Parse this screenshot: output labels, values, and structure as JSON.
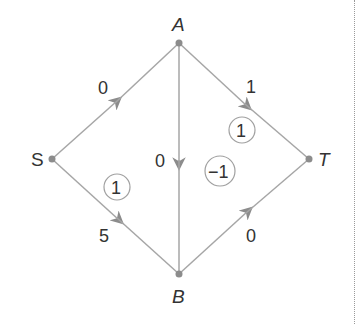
{
  "colors": {
    "edge": "#a6a6a6",
    "node": "#8c8c8c",
    "text": "#333333",
    "circle": "#a0a0a0",
    "border": "#9a9a9a"
  },
  "nodes": [
    {
      "id": "S",
      "label": "S",
      "x": 52,
      "y": 159
    },
    {
      "id": "A",
      "label": "A",
      "x": 179,
      "y": 43
    },
    {
      "id": "B",
      "label": "B",
      "x": 179,
      "y": 274
    },
    {
      "id": "T",
      "label": "T",
      "x": 309,
      "y": 159
    }
  ],
  "edges": [
    {
      "from": "S",
      "to": "A",
      "label": "0"
    },
    {
      "from": "A",
      "to": "T",
      "label": "1"
    },
    {
      "from": "A",
      "to": "B",
      "label": "0"
    },
    {
      "from": "S",
      "to": "B",
      "label": "5"
    },
    {
      "from": "B",
      "to": "T",
      "label": "0"
    }
  ],
  "circled_values": [
    {
      "region": "A-T-B face",
      "value": "1"
    },
    {
      "region": "A-B axis",
      "value": "−1"
    },
    {
      "region": "S-B face",
      "value": "1"
    }
  ]
}
